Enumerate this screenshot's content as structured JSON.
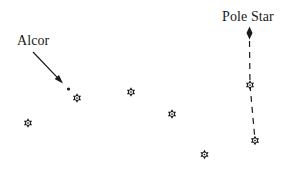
{
  "figure": {
    "colors": {
      "ink": "#1a1a1a",
      "paper": "#ffffff"
    },
    "labels": {
      "alcor": "Alcor",
      "pole_star": "Pole Star"
    },
    "stars": [
      {
        "x": 28,
        "y": 123
      },
      {
        "x": 77,
        "y": 98
      },
      {
        "x": 131,
        "y": 92
      },
      {
        "x": 172,
        "y": 114
      },
      {
        "x": 204.5,
        "y": 154.5
      },
      {
        "x": 255,
        "y": 140.5
      },
      {
        "x": 250,
        "y": 85
      }
    ],
    "alcor_dot": {
      "x": 68.5,
      "y": 89,
      "r": 1.6
    },
    "pole_star_marker": {
      "x": 249.5,
      "y": 33,
      "rx": 3,
      "ry": 6.5
    },
    "alcor_arrow": {
      "x1": 33,
      "y1": 52,
      "x2": 63,
      "y2": 83.5
    },
    "pointer_line": {
      "points": [
        [
          249.5,
          41
        ],
        [
          250,
          85
        ],
        [
          255,
          140
        ]
      ],
      "dash": "6 5"
    }
  }
}
